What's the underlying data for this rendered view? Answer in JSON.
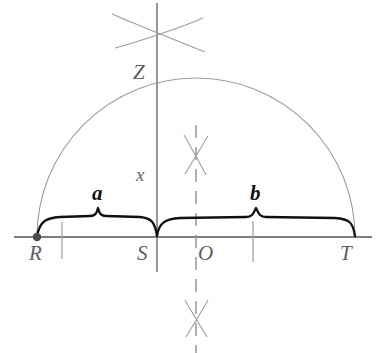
{
  "figure": {
    "type": "compass-and-straightedge-diagram",
    "colors": {
      "baseline": "#7b7e82",
      "arc": "#9a9da1",
      "construction": "#9a9da1",
      "brace": "#111111",
      "point": "#4a4d51",
      "label": "#5b5e62",
      "emphasis_label": "#111111",
      "background": "#ffffff"
    },
    "points": [
      {
        "name": "R",
        "label": "R",
        "x": 37,
        "y": 237,
        "dot": true
      },
      {
        "name": "S",
        "label": "S",
        "x": 157,
        "y": 237,
        "dot": false
      },
      {
        "name": "O",
        "label": "O",
        "x": 196,
        "y": 237,
        "dot": false
      },
      {
        "name": "T",
        "label": "T",
        "x": 355,
        "y": 237,
        "dot": false
      },
      {
        "name": "Z",
        "label": "Z",
        "x": 157,
        "y": 82,
        "dot": false
      }
    ],
    "segments": [
      {
        "name": "a",
        "label": "a",
        "from": "R",
        "to": "S"
      },
      {
        "name": "b",
        "label": "b",
        "from": "S",
        "to": "T"
      },
      {
        "name": "x",
        "label": "x",
        "from": "S",
        "to": "Z"
      }
    ],
    "labels": {
      "point_R": "R",
      "point_S": "S",
      "point_O": "O",
      "point_T": "T",
      "point_Z": "Z",
      "segment_a": "a",
      "segment_b": "b",
      "altitude_x": "x"
    },
    "semicircle": {
      "center_x": 196,
      "center_y": 237,
      "radius": 159,
      "diameter_endpoints": [
        "R",
        "T"
      ]
    },
    "baseline": {
      "y": 237,
      "x_start": 14,
      "x_end": 372
    },
    "vertical_line_at_S": {
      "x": 157,
      "y_top": 3,
      "y_bottom": 272
    },
    "dashed_line_at_O": {
      "x": 196,
      "y_top": 125,
      "y_bottom": 353
    },
    "arc_crosses": [
      {
        "name": "upper-cross",
        "x": 159,
        "y": 32
      },
      {
        "name": "middle-cross",
        "x": 196,
        "y": 155
      },
      {
        "name": "lower-cross",
        "x": 196,
        "y": 318
      }
    ],
    "tick_marks": [
      {
        "name": "tick-left",
        "x": 62
      },
      {
        "name": "tick-right",
        "x": 253
      }
    ]
  }
}
